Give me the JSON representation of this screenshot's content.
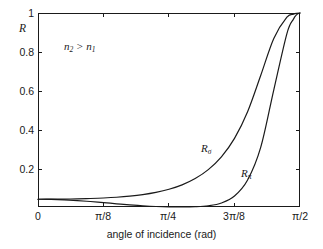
{
  "chart_data": {
    "type": "line",
    "title": "",
    "xlabel": "angle of incidence (rad)",
    "ylabel": "R",
    "xlim": [
      0,
      1.5707963
    ],
    "ylim": [
      0,
      1
    ],
    "grid": false,
    "legend_position": "inline-curve-labels",
    "xtick_labels": [
      "0",
      "π/8",
      "π/4",
      "3π/8",
      "π/2"
    ],
    "xtick_values": [
      0,
      0.3926991,
      0.7853982,
      1.1780972,
      1.5707963
    ],
    "ytick_labels": [
      "0",
      "0.2",
      "0.4",
      "0.6",
      "0.8",
      "1"
    ],
    "ytick_values": [
      0,
      0.2,
      0.4,
      0.6,
      0.8,
      1
    ],
    "annotations": [
      {
        "name": "refractive-index-condition",
        "text": "n2 > n1",
        "text_parts": {
          "n_left": "n",
          "sub_left": "2",
          "operator": " > ",
          "n_right": "n",
          "sub_right": "1"
        },
        "x": 0.16,
        "y": 0.85
      }
    ],
    "series": [
      {
        "name": "R_sigma",
        "label_base": "R",
        "label_subscript": "σ",
        "label_x": 1.12,
        "label_y": 0.33,
        "color": "#1a1a1a",
        "x": [
          0.0,
          0.0785,
          0.1571,
          0.2356,
          0.3142,
          0.3927,
          0.4712,
          0.5498,
          0.6283,
          0.7069,
          0.7854,
          0.8639,
          0.9425,
          1.021,
          1.0996,
          1.1781,
          1.2566,
          1.3352,
          1.4137,
          1.4923,
          1.5315,
          1.5512,
          1.5708
        ],
        "y": [
          0.04,
          0.0402,
          0.0408,
          0.0419,
          0.0437,
          0.0464,
          0.0503,
          0.056,
          0.064,
          0.0754,
          0.0915,
          0.1143,
          0.1466,
          0.1926,
          0.2585,
          0.3535,
          0.4912,
          0.678,
          0.8692,
          0.9783,
          0.994,
          0.9985,
          1.0
        ]
      },
      {
        "name": "R_pi",
        "label_base": "R",
        "label_subscript": "π",
        "label_x": 1.32,
        "label_y": 0.2,
        "color": "#1a1a1a",
        "x": [
          0.0,
          0.0785,
          0.1571,
          0.2356,
          0.3142,
          0.3927,
          0.4712,
          0.5498,
          0.6283,
          0.7069,
          0.7854,
          0.8639,
          0.9425,
          1.021,
          1.0996,
          1.1781,
          1.2566,
          1.3352,
          1.4137,
          1.4923,
          1.5315,
          1.5512,
          1.5708
        ],
        "y": [
          0.04,
          0.0392,
          0.0369,
          0.0332,
          0.0283,
          0.0226,
          0.0166,
          0.0109,
          0.0062,
          0.0027,
          0.0007,
          0.0,
          0.0014,
          0.0065,
          0.0208,
          0.0566,
          0.1391,
          0.3072,
          0.6041,
          0.8941,
          0.9684,
          0.9916,
          1.0
        ]
      }
    ]
  },
  "axes": {
    "ylabel_text": "R",
    "xlabel_text": "angle of incidence (rad)"
  }
}
